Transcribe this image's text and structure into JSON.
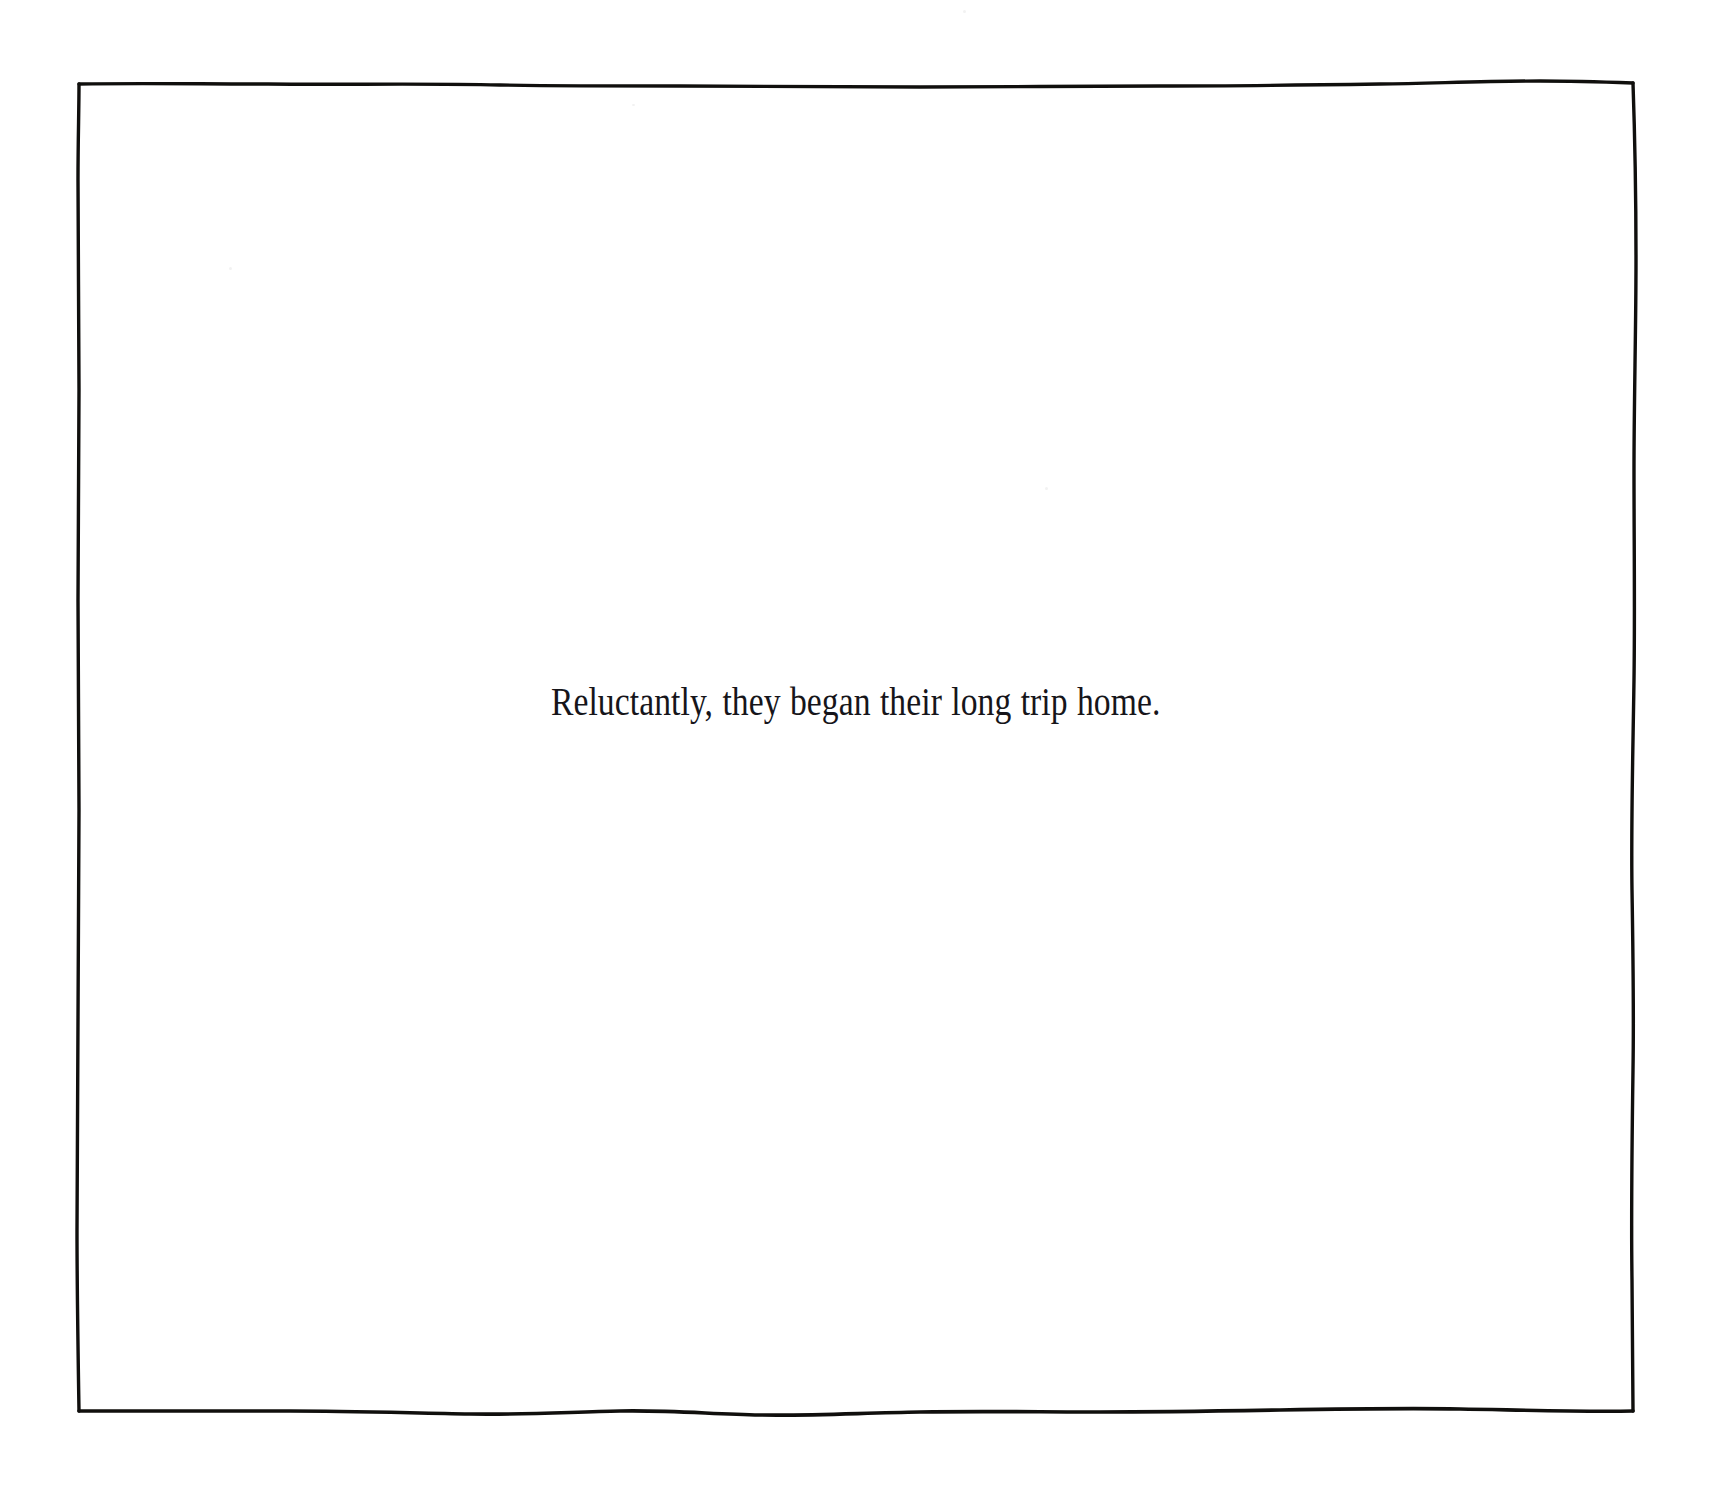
{
  "page": {
    "width": 1710,
    "height": 1502,
    "background_color": "#ffffff",
    "kind": "illustrated-storybook-page"
  },
  "frame": {
    "name": "hand-drawn-border",
    "style": "wobbly ink rectangle",
    "stroke_color": "#100f0d",
    "stroke_width_px": 3,
    "bounds": {
      "left": 78,
      "top": 83,
      "right": 1633,
      "bottom": 1411
    }
  },
  "caption": {
    "text": "Reluctantly, they began their long trip home.",
    "color": "#16151a",
    "alignment": "center",
    "font_size_px": 41,
    "style": "condensed serif"
  }
}
